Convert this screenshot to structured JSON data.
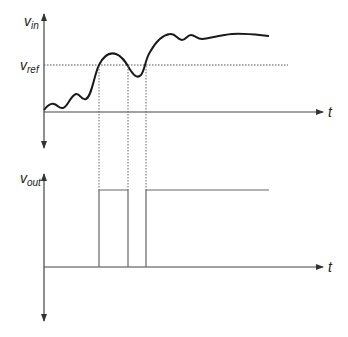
{
  "diagram": {
    "type": "comparator-timing",
    "top_plot": {
      "y_axis_label_main": "v",
      "y_axis_label_sub": "in",
      "ref_label_main": "v",
      "ref_label_sub": "ref",
      "x_axis_label": "t"
    },
    "bottom_plot": {
      "y_axis_label_main": "v",
      "y_axis_label_sub": "out",
      "x_axis_label": "t"
    },
    "crossings_x_px": [
      99,
      128,
      146
    ],
    "colors": {
      "line": "#222222",
      "axis": "#444444",
      "dotted": "#555555",
      "pulse": "#666666"
    }
  }
}
